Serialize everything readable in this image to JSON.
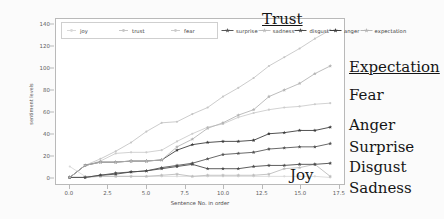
{
  "chart_data": {
    "type": "line",
    "title": "",
    "xlabel": "Sentence No. in order",
    "ylabel": "sentiment levels",
    "xlim": [
      -0.9,
      17.9
    ],
    "ylim": [
      -6,
      145
    ],
    "xticks": [
      "0.0",
      "2.5",
      "5.0",
      "7.5",
      "10.0",
      "12.5",
      "15.0",
      "17.5"
    ],
    "xtick_values": [
      0.0,
      2.5,
      5.0,
      7.5,
      10.0,
      12.5,
      15.0,
      17.5
    ],
    "yticks": [
      "0",
      "20",
      "40",
      "60",
      "80",
      "100",
      "120",
      "140"
    ],
    "ytick_values": [
      0,
      20,
      40,
      60,
      80,
      100,
      120,
      140
    ],
    "grid": false,
    "legend_position": "upper left",
    "x": [
      0,
      1,
      2,
      3,
      4,
      5,
      6,
      7,
      8,
      9,
      10,
      11,
      12,
      13,
      14,
      15,
      16,
      17
    ],
    "series": [
      {
        "name": "joy",
        "color": "#d9d9d9",
        "marker": "point",
        "values": [
          10,
          1,
          1,
          1,
          1,
          1,
          1,
          1,
          1,
          1,
          1,
          1,
          1,
          1,
          1,
          1,
          1,
          0
        ]
      },
      {
        "name": "trust",
        "color": "#c6c6c6",
        "marker": "point",
        "values": [
          0,
          11,
          17,
          24,
          32,
          42,
          50,
          51,
          58,
          64,
          74,
          82,
          91,
          102,
          110,
          118,
          127,
          135
        ]
      },
      {
        "name": "fear",
        "color": "#cccccc",
        "marker": "point",
        "values": [
          0,
          11,
          15,
          22,
          23,
          23,
          25,
          33,
          40,
          46,
          49,
          55,
          59,
          62,
          64,
          65,
          67,
          68
        ]
      },
      {
        "name": "surprise",
        "color": "#565656",
        "marker": "star",
        "values": [
          0,
          0,
          2,
          4,
          5,
          6,
          9,
          11,
          13,
          17,
          21,
          22,
          23,
          26,
          27,
          28,
          28,
          31
        ]
      },
      {
        "name": "sadness",
        "color": "#bdbdbd",
        "marker": "star",
        "values": [
          0,
          0,
          1,
          1,
          1,
          1,
          2,
          3,
          1,
          2,
          2,
          2,
          2,
          3,
          8,
          9,
          12,
          1
        ]
      },
      {
        "name": "disgust",
        "color": "#4a4a4a",
        "marker": "star",
        "values": [
          0,
          0,
          2,
          3,
          5,
          6,
          8,
          10,
          12,
          8,
          8,
          8,
          10,
          11,
          11,
          12,
          12,
          13
        ]
      },
      {
        "name": "anger",
        "color": "#3d3d3d",
        "marker": "star",
        "values": [
          0,
          11,
          14,
          14,
          15,
          15,
          16,
          25,
          30,
          32,
          33,
          33,
          34,
          40,
          41,
          43,
          43,
          46
        ]
      },
      {
        "name": "expectation",
        "color": "#b5b5b5",
        "marker": "star",
        "values": [
          0,
          11,
          14,
          14,
          15,
          15,
          16,
          28,
          35,
          45,
          50,
          57,
          62,
          74,
          80,
          86,
          95,
          102
        ]
      }
    ],
    "annotations": [
      {
        "text": "Trust",
        "underline": true,
        "position": "inside-top-right"
      },
      {
        "text": "Expectation",
        "underline": true,
        "position": "right"
      },
      {
        "text": "Fear",
        "underline": false,
        "position": "right"
      },
      {
        "text": "Anger",
        "underline": false,
        "position": "right"
      },
      {
        "text": "Surprise",
        "underline": false,
        "position": "right"
      },
      {
        "text": "Disgust",
        "underline": false,
        "position": "right"
      },
      {
        "text": "Sadness",
        "underline": false,
        "position": "right"
      },
      {
        "text": "Joy",
        "underline": false,
        "position": "inside-bottom-right"
      }
    ]
  },
  "legend": {
    "items": [
      {
        "label": "joy",
        "marker": "point"
      },
      {
        "label": "trust",
        "marker": "point"
      },
      {
        "label": "fear",
        "marker": "point"
      },
      {
        "label": "surprise",
        "marker": "star"
      },
      {
        "label": "sadness",
        "marker": "star"
      },
      {
        "label": "disgust",
        "marker": "star"
      },
      {
        "label": "anger",
        "marker": "star"
      },
      {
        "label": "expectation",
        "marker": "star"
      }
    ]
  },
  "annotations_right": [
    {
      "text": "Trust",
      "underline": true
    },
    {
      "text": "Expectation",
      "underline": true
    },
    {
      "text": "Fear",
      "underline": false
    },
    {
      "text": "Anger",
      "underline": false
    },
    {
      "text": "Surprise",
      "underline": false
    },
    {
      "text": "Disgust",
      "underline": false
    },
    {
      "text": "Sadness",
      "underline": false
    }
  ],
  "inplot_labels": [
    {
      "text": "Trust"
    },
    {
      "text": "Joy"
    }
  ]
}
